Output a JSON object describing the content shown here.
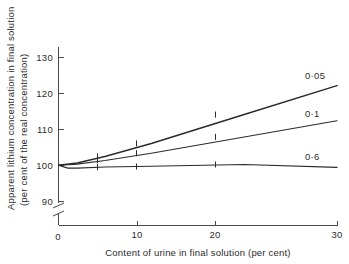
{
  "chart_data": {
    "type": "line",
    "title": "",
    "xlabel": "Content of urine in final solution (per cent)",
    "ylabel_line1": "Apparent lithium concentration in final solution",
    "ylabel_line2": "(per cent of the real concentration)",
    "xlim": [
      0,
      30
    ],
    "ylim": [
      90,
      133
    ],
    "grid": false,
    "axis_break": {
      "axis": "y",
      "below_value": 90,
      "note": "y-axis broken between 90 and the x-axis baseline"
    },
    "xticks": [
      0,
      10,
      20,
      30
    ],
    "xtick_labels": [
      "0",
      "10",
      "20",
      "30"
    ],
    "yticks": [
      90,
      100,
      110,
      120,
      130
    ],
    "ytick_labels": [
      "90",
      "100",
      "110",
      "120",
      "130"
    ],
    "legend_position": "right-inline-end-of-line",
    "series": [
      {
        "name": "0·05",
        "label": "0·05",
        "x": [
          0,
          2,
          5,
          10,
          20,
          30
        ],
        "values": [
          100,
          100.6,
          102.4,
          106,
          114,
          122
        ],
        "color": "#2b2b2b",
        "markers_at": [
          5,
          10,
          20,
          30
        ]
      },
      {
        "name": "0·1",
        "label": "0·1",
        "x": [
          0,
          2,
          5,
          10,
          20,
          30
        ],
        "values": [
          100,
          100.3,
          101.3,
          103.3,
          107.8,
          112.3
        ],
        "color": "#2b2b2b",
        "markers_at": [
          5,
          10,
          20,
          30
        ]
      },
      {
        "name": "0·6",
        "label": "0·6",
        "x": [
          0,
          1,
          2,
          5,
          10,
          20,
          30
        ],
        "values": [
          100,
          99.2,
          99.2,
          99.5,
          99.7,
          100.2,
          99.4
        ],
        "color": "#2b2b2b",
        "markers_at": [
          5,
          10,
          20,
          30
        ]
      }
    ]
  },
  "axes": {
    "x_title": "Content of urine in final solution (per cent)",
    "y_title_line1": "Apparent lithium concentration in final solution",
    "y_title_line2": "(per cent of the real concentration)",
    "x_tick_0": "0",
    "x_tick_10": "10",
    "x_tick_20": "20",
    "x_tick_30": "30",
    "y_tick_90": "90",
    "y_tick_100": "100",
    "y_tick_110": "110",
    "y_tick_120": "120",
    "y_tick_130": "130"
  },
  "series_labels": {
    "s1": "0·05",
    "s2": "0·1",
    "s3": "0·6"
  },
  "colors": {
    "ink": "#2b2b2b",
    "axis": "#4a4a4a",
    "background": "#ffffff"
  }
}
